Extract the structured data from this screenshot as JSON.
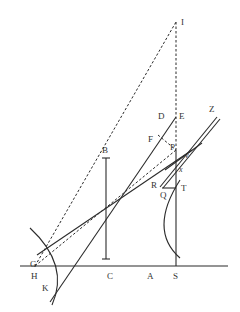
{
  "diagram": {
    "type": "geometric optics construction",
    "labels": {
      "I": "I",
      "E": "E",
      "D": "D",
      "Z": "Z",
      "F": "F",
      "P": "P",
      "v": "v",
      "x": "x",
      "R": "R",
      "T": "T",
      "Q": "Q",
      "B": "B",
      "H": "H",
      "C": "C",
      "A": "A",
      "S": "S",
      "G": "G",
      "K": "K"
    },
    "colors": {
      "line": "#2b2b2b",
      "background": "#ffffff"
    }
  }
}
